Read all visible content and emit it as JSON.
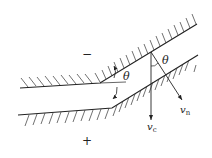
{
  "diagram": {
    "type": "channel-bend-flow",
    "colors": {
      "stroke": "#222222",
      "hatch": "#333333",
      "background": "#ffffff"
    },
    "labels": {
      "minus_sign": "−",
      "plus_sign": "+",
      "theta_bend": "θ",
      "theta_vector": "θ",
      "v_c": "v",
      "v_c_sub": "c",
      "v_n": "v",
      "v_n_sub": "n"
    },
    "walls": {
      "upper": {
        "points": [
          [
            20,
            88
          ],
          [
            100,
            83
          ],
          [
            197,
            24
          ]
        ],
        "hatch_side": "above"
      },
      "lower": {
        "points": [
          [
            18,
            115
          ],
          [
            112,
            108
          ],
          [
            198,
            55
          ]
        ],
        "hatch_side": "below"
      }
    },
    "vectors": {
      "origin": [
        151,
        52
      ],
      "v_c_end": [
        151,
        121
      ],
      "v_n_end": [
        183,
        101
      ]
    }
  }
}
